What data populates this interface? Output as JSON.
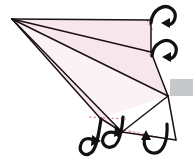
{
  "figure": {
    "title": "Origami fold step diagram",
    "type": "instructional-diagram",
    "background_color": "#ffffff",
    "paper_fill_color": "#f7e6ec",
    "paper_fill_color_light": "#fbf2f5",
    "fold_line_color": "#1a1013",
    "crease_dash_color": "#e8839e",
    "arrow_color": "#111111",
    "gray_bar_color": "#c6c8ca",
    "canvas": {
      "width": 193,
      "height": 168
    }
  },
  "shapes": {
    "apex": {
      "label": "apex-point",
      "x": 12,
      "y": 19
    },
    "panels": [
      {
        "name": "panel-top",
        "points": "12,19 151,20 151,52 12,19",
        "fill": "#f7e6ec"
      },
      {
        "name": "panel-upper-middle",
        "points": "12,19 151,52 168,96 12,19",
        "fill": "#f7e6ec"
      },
      {
        "name": "panel-lower-middle",
        "points": "12,19 168,96 100,118 12,19",
        "fill": "#fbf2f5"
      },
      {
        "name": "panel-bottom-wedge",
        "points": "12,19 100,118 122,132 12,19",
        "fill": "#f7e6ec"
      },
      {
        "name": "panel-right-tail",
        "points": "168,96 176,140 122,132 168,96",
        "fill": "#ffffff"
      }
    ],
    "fold_lines": [
      {
        "name": "fold-line-top-edge",
        "x1": 12,
        "y1": 19,
        "x2": 151,
        "y2": 20
      },
      {
        "name": "fold-line-1",
        "x1": 12,
        "y1": 19,
        "x2": 151,
        "y2": 52
      },
      {
        "name": "fold-line-2",
        "x1": 12,
        "y1": 19,
        "x2": 168,
        "y2": 96
      },
      {
        "name": "fold-line-3",
        "x1": 12,
        "y1": 19,
        "x2": 100,
        "y2": 118
      },
      {
        "name": "fold-line-4",
        "x1": 12,
        "y1": 19,
        "x2": 122,
        "y2": 132
      },
      {
        "name": "edge-right-upper",
        "x1": 151,
        "y1": 20,
        "x2": 151,
        "y2": 52
      },
      {
        "name": "edge-right-lower",
        "x1": 151,
        "y1": 52,
        "x2": 168,
        "y2": 96
      },
      {
        "name": "edge-tail-right",
        "x1": 168,
        "y1": 96,
        "x2": 176,
        "y2": 140
      },
      {
        "name": "edge-tail-bottom",
        "x1": 176,
        "y1": 140,
        "x2": 122,
        "y2": 132
      },
      {
        "name": "edge-tail-left",
        "x1": 122,
        "y1": 132,
        "x2": 168,
        "y2": 96
      },
      {
        "name": "edge-bottom-wedge",
        "x1": 100,
        "y1": 118,
        "x2": 122,
        "y2": 132
      }
    ],
    "crease_lines": [
      {
        "name": "crease-top-right",
        "x1": 147,
        "y1": 20,
        "x2": 153,
        "y2": 31
      },
      {
        "name": "crease-mid-right",
        "x1": 146,
        "y1": 51,
        "x2": 154,
        "y2": 58
      },
      {
        "name": "crease-bottom",
        "x1": 89,
        "y1": 117,
        "x2": 126,
        "y2": 119
      },
      {
        "name": "crease-tail",
        "x1": 124,
        "y1": 130,
        "x2": 158,
        "y2": 137
      }
    ],
    "gray_bar": {
      "name": "gray-bar",
      "x": 170,
      "y": 79,
      "width": 23,
      "height": 17
    },
    "arrows": [
      {
        "name": "arrow-fold-top-right",
        "direction": "curl-down-left"
      },
      {
        "name": "arrow-fold-mid-right",
        "direction": "curl-down-left"
      },
      {
        "name": "arrow-fold-bottom-left",
        "direction": "curl-up-right"
      },
      {
        "name": "arrow-fold-bottom-center",
        "direction": "curl-up-right"
      },
      {
        "name": "arrow-fold-bottom-right",
        "direction": "curl-up"
      }
    ]
  }
}
